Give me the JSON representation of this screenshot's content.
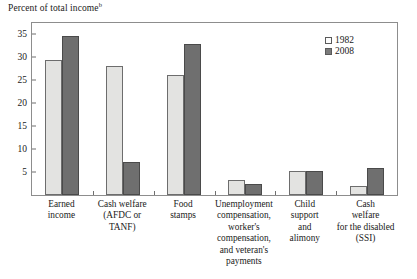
{
  "axis_title": {
    "text": "Percent of total income",
    "footnote_marker": "b"
  },
  "legend": {
    "position": "top-right-inside",
    "entries": [
      {
        "label": "1982",
        "swatch": "light-square-swatch",
        "color": "#e3e3e1"
      },
      {
        "label": "2008",
        "swatch": "dark-square-swatch",
        "color": "#6f6f6f"
      }
    ]
  },
  "y_axis": {
    "ticks": [
      "5",
      "10",
      "15",
      "20",
      "25",
      "30",
      "35"
    ],
    "tick_values": [
      5,
      10,
      15,
      20,
      25,
      30,
      35
    ],
    "min": 0,
    "max": 37.5
  },
  "chart_data": {
    "type": "bar",
    "title": "Percent of total income",
    "xlabel": "",
    "ylabel": "Percent of total income",
    "ylim": [
      0,
      37.5
    ],
    "ytick_values": [
      5,
      10,
      15,
      20,
      25,
      30,
      35
    ],
    "grid": false,
    "legend_position": "upper right (inside plot area)",
    "categories": [
      "Earned income",
      "Cash welfare (AFDC or TANF)",
      "Food stamps",
      "Unemployment compensation, worker's compensation, and veteran's payments",
      "Child support and alimony",
      "Cash welfare for the disabled (SSI)"
    ],
    "category_lines": [
      [
        "Earned",
        "income"
      ],
      [
        "Cash welfare",
        "(AFDC or",
        "TANF)"
      ],
      [
        "Food",
        "stamps"
      ],
      [
        "Unemployment",
        "compensation,",
        "worker's",
        "compensation,",
        "and veteran's",
        "payments"
      ],
      [
        "Child",
        "support",
        "and",
        "alimony"
      ],
      [
        "Cash",
        "welfare",
        "for the disabled",
        "(SSI)"
      ]
    ],
    "series": [
      {
        "name": "1982",
        "color": "#e3e3e1",
        "values": [
          29.5,
          28.1,
          26.2,
          3.2,
          5.3,
          2.0
        ]
      },
      {
        "name": "2008",
        "color": "#6f6f6f",
        "values": [
          34.6,
          7.3,
          33.0,
          2.3,
          5.3,
          5.9
        ]
      }
    ]
  }
}
